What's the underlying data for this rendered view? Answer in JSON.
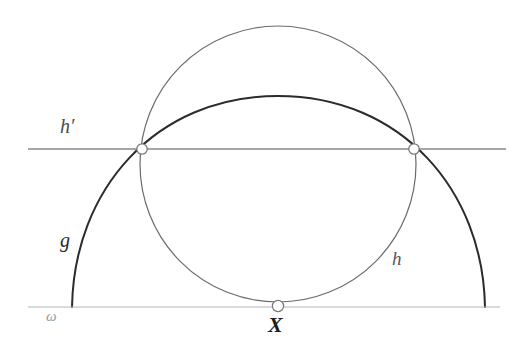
{
  "figure": {
    "background_color": "#ffffff"
  },
  "labels": {
    "h_prime": "h′",
    "g": "g",
    "h": "h",
    "omega": "ω",
    "X": "X"
  },
  "colors": {
    "arc_g": "#2b2b2b",
    "circle_h": "#6b6b6b",
    "line_h_prime": "#8a8a8a",
    "line_omega": "#b5b5b5",
    "marker_stroke": "#7a7a7a",
    "marker_fill": "#ffffff"
  },
  "geometry": {
    "canvas": {
      "width": 523,
      "height": 356
    },
    "line_omega": {
      "y": 307,
      "x_start": 28,
      "x_end": 500,
      "stroke_width": 1.2
    },
    "line_h_prime": {
      "y": 149,
      "x_start": 28,
      "x_end": 506,
      "stroke_width": 1.4
    },
    "circle_h": {
      "cx": 278,
      "cy": 164,
      "r": 138,
      "stroke_width": 1.2
    },
    "arc_g": {
      "start": {
        "x": 72,
        "y": 307
      },
      "apex": {
        "x": 278,
        "y": 96
      },
      "end": {
        "x": 485,
        "y": 307
      },
      "stroke_width": 2.0,
      "path": "M 72 307 C 74 190 155 96 278 96 C 401 96 483 190 485 307"
    },
    "points": [
      {
        "name": "intersection-left",
        "x": 142,
        "y": 149,
        "r": 5.2
      },
      {
        "name": "intersection-right",
        "x": 414,
        "y": 149,
        "r": 5.2
      },
      {
        "name": "tangency-X",
        "x": 278,
        "y": 306,
        "r": 5.6
      }
    ]
  }
}
